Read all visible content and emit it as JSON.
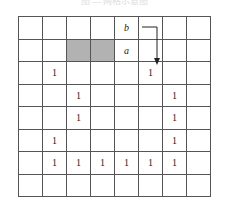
{
  "caption": "图 — 网格示意图",
  "grid": {
    "rows": 8,
    "cols": 8,
    "colors": {
      "shade": "#b2b2b2",
      "line": "#555555"
    },
    "cells": [
      [
        "",
        "",
        "",
        "",
        "b",
        "",
        "",
        ""
      ],
      [
        "",
        "",
        "",
        "",
        "a",
        "",
        "",
        ""
      ],
      [
        "",
        "1",
        "",
        "",
        "",
        "1",
        "",
        ""
      ],
      [
        "",
        "",
        "1",
        "",
        "",
        "",
        "1",
        ""
      ],
      [
        "",
        "",
        "1",
        "",
        "",
        "",
        "1",
        ""
      ],
      [
        "",
        "1",
        "",
        "",
        "",
        "",
        "1",
        ""
      ],
      [
        "",
        "1",
        "1",
        "1",
        "1",
        "1",
        "1",
        ""
      ],
      [
        "",
        "",
        "",
        "",
        "",
        "",
        "",
        ""
      ]
    ],
    "shaded": [
      [
        1,
        2
      ],
      [
        1,
        3
      ]
    ],
    "italic": [
      [
        0,
        4
      ],
      [
        1,
        4
      ]
    ]
  },
  "arrow": {
    "from_label": "b",
    "from_cell": [
      0,
      4
    ],
    "to_cell": [
      2,
      5
    ],
    "path": "right-then-down"
  }
}
